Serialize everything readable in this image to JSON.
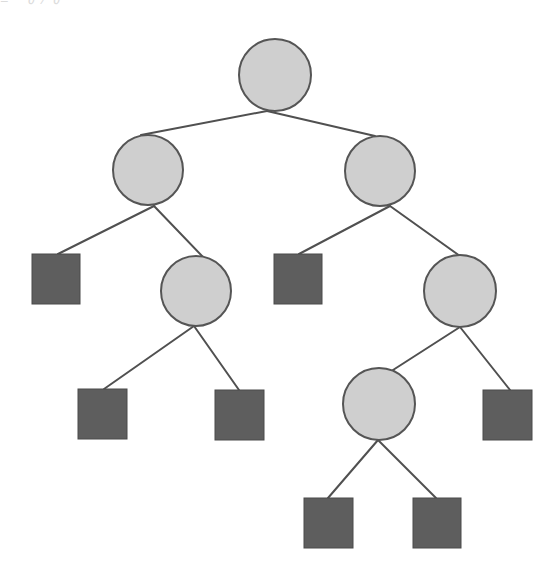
{
  "diagram": {
    "type": "binary-tree",
    "top_remnant_text": "≡ ∂∕∂",
    "colors": {
      "background": "#ffffff",
      "internal_fill": "#cfcfcf",
      "internal_stroke": "#555555",
      "leaf_fill": "#5e5e5e",
      "leaf_stroke": "#4a4a4a",
      "edge": "#505050"
    },
    "internal_nodes": [
      {
        "id": "n0",
        "cx": 275,
        "cy": 75,
        "r": 36
      },
      {
        "id": "n1",
        "cx": 148,
        "cy": 170,
        "r": 35
      },
      {
        "id": "n2",
        "cx": 380,
        "cy": 171,
        "r": 35
      },
      {
        "id": "n3",
        "cx": 196,
        "cy": 291,
        "r": 35
      },
      {
        "id": "n4",
        "cx": 460,
        "cy": 291,
        "r": 36
      },
      {
        "id": "n5",
        "cx": 379,
        "cy": 404,
        "r": 36
      }
    ],
    "leaf_nodes": [
      {
        "id": "l0",
        "x": 32,
        "y": 254,
        "w": 48,
        "h": 50
      },
      {
        "id": "l1",
        "x": 274,
        "y": 254,
        "w": 48,
        "h": 50
      },
      {
        "id": "l2",
        "x": 78,
        "y": 389,
        "w": 49,
        "h": 50
      },
      {
        "id": "l3",
        "x": 215,
        "y": 390,
        "w": 49,
        "h": 50
      },
      {
        "id": "l4",
        "x": 483,
        "y": 390,
        "w": 49,
        "h": 50
      },
      {
        "id": "l5",
        "x": 304,
        "y": 498,
        "w": 49,
        "h": 50
      },
      {
        "id": "l6",
        "x": 413,
        "y": 498,
        "w": 48,
        "h": 50
      }
    ],
    "edges": [
      {
        "from": "n0",
        "to": "n1",
        "x1": 267,
        "y1": 111,
        "x2": 141,
        "y2": 135
      },
      {
        "from": "n0",
        "to": "n2",
        "x1": 267,
        "y1": 111,
        "x2": 375,
        "y2": 136
      },
      {
        "from": "n1",
        "to": "l0",
        "x1": 154,
        "y1": 206,
        "x2": 58,
        "y2": 254
      },
      {
        "from": "n1",
        "to": "n3",
        "x1": 154,
        "y1": 206,
        "x2": 203,
        "y2": 257
      },
      {
        "from": "n2",
        "to": "l1",
        "x1": 390,
        "y1": 206,
        "x2": 299,
        "y2": 254
      },
      {
        "from": "n2",
        "to": "n4",
        "x1": 390,
        "y1": 206,
        "x2": 460,
        "y2": 256
      },
      {
        "from": "n3",
        "to": "l2",
        "x1": 194,
        "y1": 326,
        "x2": 104,
        "y2": 389
      },
      {
        "from": "n3",
        "to": "l3",
        "x1": 194,
        "y1": 326,
        "x2": 239,
        "y2": 390
      },
      {
        "from": "n4",
        "to": "n5",
        "x1": 460,
        "y1": 327,
        "x2": 393,
        "y2": 370
      },
      {
        "from": "n4",
        "to": "l4",
        "x1": 460,
        "y1": 327,
        "x2": 510,
        "y2": 390
      },
      {
        "from": "n5",
        "to": "l5",
        "x1": 378,
        "y1": 440,
        "x2": 328,
        "y2": 498
      },
      {
        "from": "n5",
        "to": "l6",
        "x1": 378,
        "y1": 440,
        "x2": 436,
        "y2": 498
      }
    ]
  }
}
